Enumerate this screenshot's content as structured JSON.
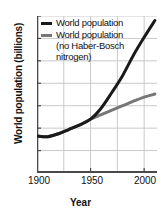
{
  "chart_data": {
    "type": "line",
    "title": "",
    "xlabel": "Year",
    "ylabel": "World population (billions)",
    "xlim": [
      1900,
      2012
    ],
    "ylim": [
      0,
      7
    ],
    "xticks": [
      1900,
      1950,
      2000
    ],
    "yticks": [
      0,
      1,
      2,
      3,
      4,
      5,
      6,
      7
    ],
    "xtick_labels": [
      "1900",
      "1950",
      "2000"
    ],
    "ytick_labels": [
      "0",
      "1",
      "2",
      "3",
      "4",
      "5",
      "6",
      "7"
    ],
    "gridlines": {
      "x": [
        1900,
        1925,
        1950,
        1975,
        2000
      ],
      "y": [
        0,
        1,
        2,
        3,
        4,
        5,
        6,
        7
      ],
      "visible": true
    },
    "legend_position": "upper left",
    "series": [
      {
        "name": "World population",
        "color": "#1a1a1a",
        "linewidth": 3,
        "x": [
          1900,
          1910,
          1920,
          1930,
          1940,
          1950,
          1960,
          1970,
          1980,
          1990,
          2000,
          2010
        ],
        "values": [
          1.65,
          1.62,
          1.75,
          1.95,
          2.15,
          2.4,
          2.9,
          3.6,
          4.35,
          5.25,
          6.05,
          6.8
        ]
      },
      {
        "name": "World population (no Haber-Bosch nitrogen)",
        "color": "#777777",
        "linewidth": 3,
        "x": [
          1900,
          1910,
          1920,
          1930,
          1940,
          1950,
          1960,
          1970,
          1980,
          1990,
          2000,
          2010
        ],
        "values": [
          1.65,
          1.62,
          1.75,
          1.95,
          2.15,
          2.4,
          2.6,
          2.8,
          3.0,
          3.2,
          3.38,
          3.52
        ]
      }
    ]
  },
  "legend": {
    "entries": [
      {
        "label": "World population",
        "color": "#1a1a1a"
      },
      {
        "label": "World population\n(no Haber-Bosch\nnitrogen)",
        "color": "#777777"
      }
    ]
  },
  "axes": {
    "y_title": "World population (billions)",
    "x_title": "Year"
  },
  "colors": {
    "series_primary": "#1a1a1a",
    "series_secondary": "#777777",
    "grid": "#c9c9c9",
    "axis": "#4a4a4a",
    "text": "#111111",
    "background": "#ffffff"
  }
}
